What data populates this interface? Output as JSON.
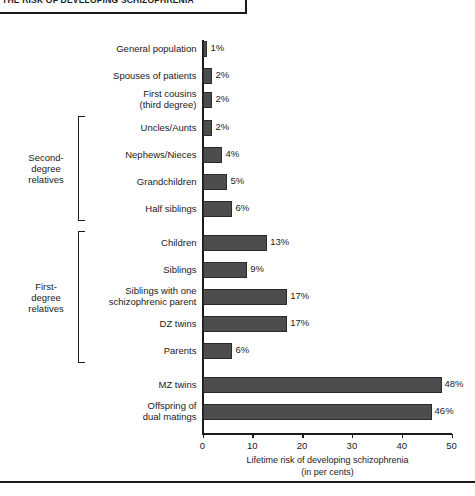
{
  "header": {
    "title": "THE RISK OF DEVELOPING SCHIZOPHRENIA"
  },
  "chart_data": {
    "type": "bar",
    "orientation": "horizontal",
    "title": "",
    "xlabel": "Lifetime risk of developing schizophrenia (in per cents)",
    "ylabel": "",
    "xlim": [
      0,
      50
    ],
    "xticks": [
      0,
      10,
      20,
      30,
      40,
      50
    ],
    "grid": false,
    "legend": null,
    "value_suffix": "%",
    "categories": [
      "General population",
      "Spouses of patients",
      "First cousins\n(third degree)",
      "Uncles/Aunts",
      "Nephews/Nieces",
      "Grandchildren",
      "Half siblings",
      "Children",
      "Siblings",
      "Siblings with one\nschizophrenic parent",
      "DZ twins",
      "Parents",
      "MZ twins",
      "Offspring of\ndual matings"
    ],
    "values": [
      1,
      2,
      2,
      2,
      4,
      5,
      6,
      13,
      9,
      17,
      17,
      6,
      48,
      46
    ],
    "value_labels": [
      "1%",
      "2%",
      "2%",
      "2%",
      "4%",
      "5%",
      "6%",
      "13%",
      "9%",
      "17%",
      "17%",
      "6%",
      "48%",
      "46%"
    ],
    "groups": [
      {
        "label": "Second-\ndegree\nrelatives",
        "from": 3,
        "to": 6
      },
      {
        "label": "First-\ndegree\nrelatives",
        "from": 7,
        "to": 11
      }
    ]
  },
  "axis_label_lines": {
    "line1": "Lifetime risk of developing schizophrenia",
    "line2": "(in per cents)"
  },
  "colors": {
    "bar_fill": "#4d4d4d",
    "bar_stroke": "#2b2b2b",
    "axis": "#1a1a1a",
    "text": "#1a1a1a",
    "background": "#ffffff"
  }
}
